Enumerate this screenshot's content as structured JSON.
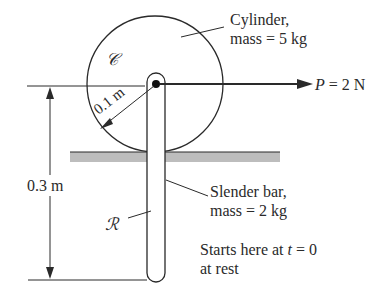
{
  "figure": {
    "cylinder": {
      "symbol": "𝒞",
      "label_line1": "Cylinder,",
      "label_line2": "mass = 5 kg",
      "radius_label": "0.1 m"
    },
    "bar": {
      "symbol": "ℛ",
      "label_line1": "Slender bar,",
      "label_line2": "mass = 2 kg",
      "length_label": "0.3 m"
    },
    "force": {
      "symbol": "P",
      "equals": "= 2 N"
    },
    "note": {
      "line1_prefix": "Starts here at ",
      "line1_var": "t",
      "line1_suffix": " = 0",
      "line2": "at rest"
    },
    "colors": {
      "ink": "#2a2a2a",
      "floor": "#bdbdbd",
      "background": "#ffffff"
    }
  }
}
